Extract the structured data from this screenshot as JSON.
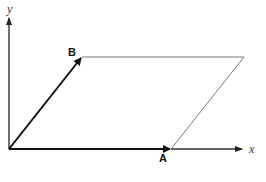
{
  "diagram": {
    "title": "",
    "type": "vector parallelogram",
    "axes": {
      "x_label": "x",
      "y_label": "y"
    },
    "vectors": [
      {
        "name": "A",
        "label": "A",
        "from": [
          9,
          149
        ],
        "to": [
          171,
          149
        ]
      },
      {
        "name": "B",
        "label": "B",
        "from": [
          9,
          149
        ],
        "to": [
          82,
          57
        ]
      }
    ],
    "parallelogram": {
      "vertices": [
        [
          9,
          149
        ],
        [
          171,
          149
        ],
        [
          244,
          57
        ],
        [
          82,
          57
        ]
      ]
    },
    "colors": {
      "vector": "#111111",
      "axis": "#222222",
      "outline": "#555555",
      "background": "#ffffff"
    }
  }
}
